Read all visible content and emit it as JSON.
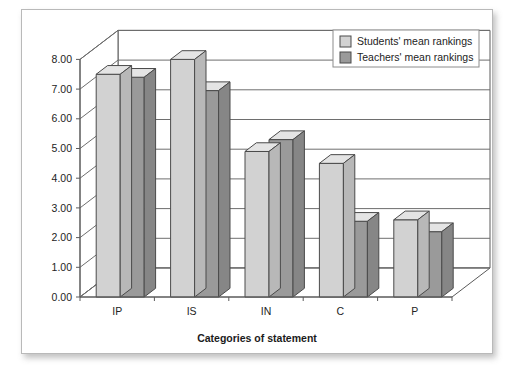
{
  "chart_data": {
    "type": "bar",
    "title": "",
    "subtitle": "",
    "xlabel": "Categories of statement",
    "ylabel": "",
    "categories": [
      "IP",
      "IS",
      "IN",
      "C",
      "P"
    ],
    "series": [
      {
        "name": "Students' mean rankings",
        "values": [
          7.5,
          8.0,
          4.9,
          4.5,
          2.6
        ],
        "color": "#d2d2d2"
      },
      {
        "name": "Teachers' mean rankings",
        "values": [
          7.4,
          6.95,
          5.3,
          2.55,
          2.2
        ],
        "color": "#9a9a9a"
      }
    ],
    "ylim": [
      0,
      8
    ],
    "ytick_step": 1,
    "ytick_labels": [
      "0.00",
      "1.00",
      "2.00",
      "3.00",
      "4.00",
      "5.00",
      "6.00",
      "7.00",
      "8.00"
    ],
    "grid": true,
    "grid_axis": "y",
    "legend_position": "top-right",
    "style": "3d-column",
    "colors": {
      "students": "#d2d2d2",
      "teachers": "#9a9a9a",
      "bar_outline": "#4a4a4a",
      "grid": "#6e6e6e",
      "axis": "#5a5a5a",
      "frame": "#b9b9b9",
      "background": "#ffffff",
      "text": "#232323"
    }
  },
  "figure": {
    "frame_label": "chart frame",
    "x_axis_title": "Categories of statement"
  },
  "legend": {
    "items": [
      {
        "label": "Students' mean rankings",
        "swatch": "students"
      },
      {
        "label": "Teachers' mean rankings",
        "swatch": "teachers"
      }
    ]
  },
  "y_axis": {
    "ticks": [
      "8.00",
      "7.00",
      "6.00",
      "5.00",
      "4.00",
      "3.00",
      "2.00",
      "1.00",
      "0.00"
    ]
  },
  "x_axis": {
    "ticks": [
      "IP",
      "IS",
      "IN",
      "C",
      "P"
    ]
  }
}
